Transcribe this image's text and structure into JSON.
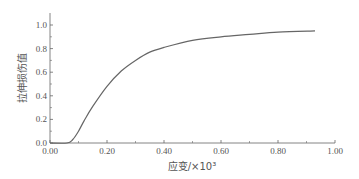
{
  "chart_data": {
    "type": "line",
    "title": "",
    "xlabel": "应变/×10³",
    "ylabel": "拉伸损伤值",
    "xlim": [
      0,
      1.0
    ],
    "ylim": [
      0,
      1.1
    ],
    "xticks": [
      "0.00",
      "0.20",
      "0.40",
      "0.60",
      "0.80",
      "1.00"
    ],
    "yticks": [
      "0.0",
      "0.2",
      "0.4",
      "0.6",
      "0.8",
      "1.0"
    ],
    "grid": false,
    "legend": null,
    "series": [
      {
        "name": "拉伸损伤",
        "x": [
          0.0,
          0.06,
          0.08,
          0.1,
          0.12,
          0.15,
          0.2,
          0.25,
          0.3,
          0.35,
          0.4,
          0.5,
          0.6,
          0.7,
          0.8,
          0.93
        ],
        "y": [
          0.0,
          0.0,
          0.03,
          0.1,
          0.19,
          0.31,
          0.48,
          0.61,
          0.7,
          0.77,
          0.81,
          0.87,
          0.9,
          0.92,
          0.94,
          0.95
        ]
      }
    ]
  }
}
